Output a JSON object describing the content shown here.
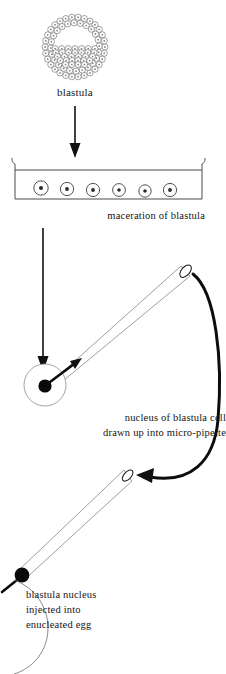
{
  "figure": {
    "background_color": "#ffffff",
    "ink_color": "#111111"
  },
  "labels": {
    "blastula": "blastula",
    "maceration": "maceration of blastula",
    "nucleus_line1": "nucleus of blastula cell",
    "nucleus_line2": "drawn up into micro-pipette",
    "inject_line1": "blastula nucleus",
    "inject_line2": "injected into",
    "inject_line3": "enucleated egg"
  },
  "stages": {
    "blastula": {
      "name": "blastula",
      "shape": "hollow sphere of cells",
      "center_x": 75,
      "center_y": 47,
      "radius": 33,
      "cell_count": 86
    },
    "dish": {
      "name": "maceration dish",
      "left": 12,
      "right": 205,
      "top": 158,
      "bottom": 200,
      "liquid_line_y": 170,
      "dissociated_cell_count": 6
    },
    "pipette_up": {
      "name": "micro-pipette aspirating nucleus",
      "tip_x": 47,
      "tip_y": 383,
      "mouth_x": 186,
      "mouth_y": 275
    },
    "pipette_down": {
      "name": "micro-pipette injecting nucleus",
      "mouth_x": 128,
      "mouth_y": 476,
      "tip_x": 20,
      "tip_y": 576
    },
    "egg": {
      "name": "enucleated egg",
      "center_x": 10,
      "center_y": 625,
      "radius": 48
    }
  },
  "arrows": {
    "blastula_to_dish": {
      "from_y": 106,
      "to_y": 157,
      "x": 75,
      "direction": "down"
    },
    "dish_to_cell": {
      "from_y": 228,
      "to_y": 370,
      "x": 43,
      "direction": "down"
    },
    "nucleus_into_pipette": {
      "direction": "up-right"
    },
    "pipette_transfer": {
      "direction": "clockwise-curve-down-left"
    }
  },
  "colors": {
    "ink": "#111111",
    "thin_stroke": "#8d8d8d",
    "text": "#141414",
    "paper": "#ffffff"
  }
}
